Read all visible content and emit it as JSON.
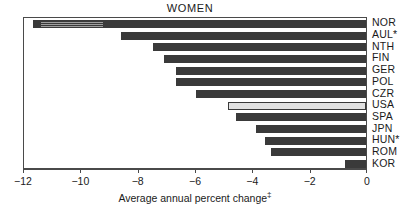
{
  "chart_data": {
    "type": "bar",
    "orientation": "horizontal",
    "title": "WOMEN",
    "xlabel": "Average annual percent change",
    "xlabel_footnote_marker": "‡",
    "ylabel": "",
    "categories": [
      "NOR",
      "AUL*",
      "NTH",
      "FIN",
      "GER",
      "POL",
      "CZR",
      "USA",
      "SPA",
      "JPN",
      "HUN*",
      "ROM",
      "KOR"
    ],
    "values": [
      -11.7,
      -8.6,
      -7.5,
      -7.1,
      -6.7,
      -6.7,
      -6.0,
      -4.9,
      -4.6,
      -3.9,
      -3.6,
      -3.4,
      -0.8
    ],
    "xlim": [
      -12,
      0
    ],
    "xticks": [
      -12,
      -10,
      -8,
      -6,
      -4,
      -2,
      0
    ],
    "xticklabels": [
      "−12",
      "−10",
      "−8",
      "−6",
      "−4",
      "−2",
      "0"
    ],
    "grid": false,
    "legend": null,
    "highlight_category": "USA",
    "bar_color": "#3a3a3a",
    "highlight_color": "#e2e2e2",
    "highlight_edge_color": "#3a3a3a",
    "axis_color": "#4a4a4a",
    "background_color": "#ffffff"
  }
}
